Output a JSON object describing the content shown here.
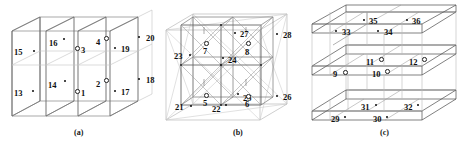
{
  "figure": {
    "title": "",
    "background": "#ffffff",
    "line_color": "#3a3a3a",
    "faint_line_color": "#b9b9b9",
    "text_color": "#101010",
    "width": 461,
    "height": 142
  },
  "panels": [
    {
      "id": "a",
      "caption": "(a)",
      "caption_x": 74,
      "caption_y": 128,
      "description": "stack of parallelogram planes with numbered node labels",
      "labels": [
        {
          "text": "15",
          "x": 14,
          "y": 48,
          "marker": "dot",
          "mx": 33,
          "my": 50
        },
        {
          "text": "16",
          "x": 49,
          "y": 39,
          "marker": "dot",
          "mx": 63,
          "my": 38
        },
        {
          "text": "3",
          "x": 81,
          "y": 46,
          "marker": "odot",
          "mx": 75,
          "my": 46
        },
        {
          "text": "4",
          "x": 96,
          "y": 38,
          "marker": "odot",
          "mx": 104,
          "my": 36
        },
        {
          "text": "19",
          "x": 121,
          "y": 45,
          "marker": "dot",
          "mx": 114,
          "my": 47
        },
        {
          "text": "20",
          "x": 146,
          "y": 34,
          "marker": "dot",
          "mx": 138,
          "my": 36
        },
        {
          "text": "13",
          "x": 14,
          "y": 89,
          "marker": "dot",
          "mx": 32,
          "my": 90
        },
        {
          "text": "14",
          "x": 48,
          "y": 81,
          "marker": "dot",
          "mx": 64,
          "my": 80
        },
        {
          "text": "1",
          "x": 81,
          "y": 89,
          "marker": "odot",
          "mx": 75,
          "my": 89
        },
        {
          "text": "2",
          "x": 96,
          "y": 80,
          "marker": "odot",
          "mx": 104,
          "my": 78
        },
        {
          "text": "17",
          "x": 121,
          "y": 88,
          "marker": "dot",
          "mx": 114,
          "my": 90
        },
        {
          "text": "18",
          "x": 146,
          "y": 76,
          "marker": "dot",
          "mx": 138,
          "my": 78
        }
      ]
    },
    {
      "id": "b",
      "caption": "(b)",
      "caption_x": 233,
      "caption_y": 128,
      "description": "nested cubes with diagonal bracing and numbered node labels",
      "labels": [
        {
          "text": "23",
          "x": 174,
          "y": 52,
          "marker": "dot",
          "mx": 189,
          "my": 54
        },
        {
          "text": "7",
          "x": 203,
          "y": 47,
          "marker": "odot",
          "mx": 204,
          "my": 41
        },
        {
          "text": "27",
          "x": 240,
          "y": 30,
          "marker": "dot",
          "mx": 234,
          "my": 32
        },
        {
          "text": "8",
          "x": 245,
          "y": 48,
          "marker": "odot",
          "mx": 246,
          "my": 41
        },
        {
          "text": "28",
          "x": 283,
          "y": 31,
          "marker": "dot",
          "mx": 276,
          "my": 33
        },
        {
          "text": "24",
          "x": 228,
          "y": 56,
          "marker": "dot",
          "mx": 222,
          "my": 57
        },
        {
          "text": "25",
          "x": 243,
          "y": 94,
          "marker": "dot",
          "mx": 237,
          "my": 93
        },
        {
          "text": "26",
          "x": 283,
          "y": 93,
          "marker": "dot",
          "mx": 276,
          "my": 95
        },
        {
          "text": "5",
          "x": 203,
          "y": 99,
          "marker": "odot",
          "mx": 204,
          "my": 93
        },
        {
          "text": "6",
          "x": 245,
          "y": 100,
          "marker": "odot",
          "mx": 246,
          "my": 94
        },
        {
          "text": "21",
          "x": 175,
          "y": 103,
          "marker": "dot",
          "mx": 190,
          "my": 105
        },
        {
          "text": "22",
          "x": 212,
          "y": 105,
          "marker": "dot",
          "mx": 225,
          "my": 104
        }
      ]
    },
    {
      "id": "c",
      "caption": "(c)",
      "caption_x": 380,
      "caption_y": 128,
      "description": "three stacked horizontal slabs with numbered node labels",
      "labels": [
        {
          "text": "35",
          "x": 369,
          "y": 17,
          "marker": "dot",
          "mx": 363,
          "my": 19
        },
        {
          "text": "36",
          "x": 412,
          "y": 17,
          "marker": "dot",
          "mx": 406,
          "my": 19
        },
        {
          "text": "33",
          "x": 342,
          "y": 28,
          "marker": "dot",
          "mx": 335,
          "my": 30
        },
        {
          "text": "34",
          "x": 384,
          "y": 28,
          "marker": "dot",
          "mx": 377,
          "my": 30
        },
        {
          "text": "11",
          "x": 366,
          "y": 58,
          "marker": "odot",
          "mx": 379,
          "my": 57
        },
        {
          "text": "12",
          "x": 409,
          "y": 58,
          "marker": "odot",
          "mx": 422,
          "my": 57
        },
        {
          "text": "9",
          "x": 333,
          "y": 70,
          "marker": "odot",
          "mx": 343,
          "my": 70
        },
        {
          "text": "10",
          "x": 372,
          "y": 70,
          "marker": "odot",
          "mx": 385,
          "my": 69
        },
        {
          "text": "31",
          "x": 361,
          "y": 103,
          "marker": "dot",
          "mx": 375,
          "my": 104
        },
        {
          "text": "32",
          "x": 404,
          "y": 103,
          "marker": "dot",
          "mx": 417,
          "my": 104
        },
        {
          "text": "29",
          "x": 331,
          "y": 115,
          "marker": "dot",
          "mx": 344,
          "my": 116
        },
        {
          "text": "30",
          "x": 373,
          "y": 115,
          "marker": "dot",
          "mx": 386,
          "my": 116
        }
      ]
    }
  ]
}
